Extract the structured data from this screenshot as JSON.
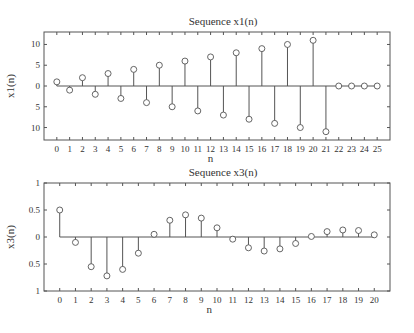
{
  "chart_data": [
    {
      "type": "stem",
      "title": "Sequence x1(n)",
      "xlabel": "n",
      "ylabel": "x1(n)",
      "xlim": [
        -1,
        26
      ],
      "ylim": [
        -13,
        13
      ],
      "xticks": [
        0,
        1,
        2,
        3,
        4,
        5,
        6,
        7,
        8,
        9,
        10,
        11,
        12,
        13,
        14,
        15,
        16,
        17,
        18,
        19,
        20,
        21,
        22,
        23,
        24,
        25
      ],
      "yticks": [
        10,
        5,
        0,
        -5,
        -10
      ],
      "ytick_labels": [
        "10",
        "5",
        "0",
        "5",
        "10"
      ],
      "grid": false,
      "x": [
        0,
        1,
        2,
        3,
        4,
        5,
        6,
        7,
        8,
        9,
        10,
        11,
        12,
        13,
        14,
        15,
        16,
        17,
        18,
        19,
        20,
        21,
        22,
        23,
        24,
        25
      ],
      "values": [
        1,
        -1,
        2,
        -2,
        3,
        -3,
        4,
        -4,
        5,
        -5,
        6,
        -6,
        7,
        -7,
        8,
        -8,
        9,
        -9,
        10,
        -10,
        11,
        -11,
        0,
        0,
        0,
        0
      ]
    },
    {
      "type": "stem",
      "title": "Sequence x3(n)",
      "xlabel": "n",
      "ylabel": "x3(n)",
      "xlim": [
        -1,
        21
      ],
      "ylim": [
        -1,
        1
      ],
      "xticks": [
        0,
        1,
        2,
        3,
        4,
        5,
        6,
        7,
        8,
        9,
        10,
        11,
        12,
        13,
        14,
        15,
        16,
        17,
        18,
        19,
        20
      ],
      "yticks": [
        1,
        0.5,
        0,
        -0.5,
        -1
      ],
      "ytick_labels": [
        "1",
        "0.5",
        "0",
        "0.5",
        "1"
      ],
      "grid": false,
      "x": [
        0,
        1,
        2,
        3,
        4,
        5,
        6,
        7,
        8,
        9,
        10,
        11,
        12,
        13,
        14,
        15,
        16,
        17,
        18,
        19,
        20
      ],
      "values": [
        0.5,
        -0.1,
        -0.55,
        -0.72,
        -0.6,
        -0.3,
        0.05,
        0.31,
        0.41,
        0.35,
        0.17,
        -0.04,
        -0.2,
        -0.26,
        -0.22,
        -0.12,
        0.01,
        0.1,
        0.13,
        0.12,
        0.04
      ]
    }
  ],
  "layout": [
    {
      "left": 44,
      "right": 390,
      "top": 32,
      "bottom": 140,
      "title_y": 25,
      "xlabel_y": 162
    },
    {
      "left": 44,
      "right": 390,
      "top": 183,
      "bottom": 291,
      "title_y": 176,
      "xlabel_y": 313
    }
  ],
  "colors": {
    "axis": "#555555",
    "stem": "#555555",
    "marker": "#555555",
    "text": "#333333"
  }
}
